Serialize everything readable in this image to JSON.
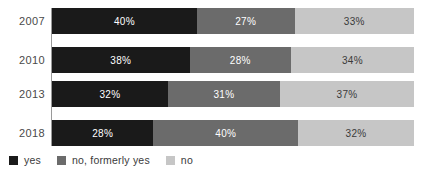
{
  "chart_data": {
    "type": "bar",
    "subtype": "stacked-horizontal-100",
    "title": "",
    "subtitle": "",
    "xlabel": "",
    "ylabel": "",
    "xlim": [
      0,
      100
    ],
    "grid": false,
    "legend_position": "bottom-left",
    "categories": [
      "2007",
      "2010",
      "2013",
      "2018"
    ],
    "series": [
      {
        "name": "yes",
        "color": "#1a1a1a",
        "values": [
          40,
          38,
          32,
          28
        ],
        "labels": [
          "40%",
          "38%",
          "32%",
          "28%"
        ]
      },
      {
        "name": "no, formerly yes",
        "color": "#6b6b6b",
        "values": [
          27,
          28,
          31,
          40
        ],
        "labels": [
          "27%",
          "28%",
          "31%",
          "40%"
        ]
      },
      {
        "name": "no",
        "color": "#c6c6c6",
        "values": [
          33,
          34,
          37,
          32
        ],
        "labels": [
          "33%",
          "34%",
          "37%",
          "32%"
        ]
      }
    ],
    "rows": [
      {
        "category": "2007",
        "segments": [
          {
            "name": "yes",
            "value": 40,
            "label": "40%"
          },
          {
            "name": "no, formerly yes",
            "value": 27,
            "label": "27%"
          },
          {
            "name": "no",
            "value": 33,
            "label": "33%"
          }
        ]
      },
      {
        "category": "2010",
        "segments": [
          {
            "name": "yes",
            "value": 38,
            "label": "38%"
          },
          {
            "name": "no, formerly yes",
            "value": 28,
            "label": "28%"
          },
          {
            "name": "no",
            "value": 34,
            "label": "34%"
          }
        ]
      },
      {
        "category": "2013",
        "segments": [
          {
            "name": "yes",
            "value": 32,
            "label": "32%"
          },
          {
            "name": "no, formerly yes",
            "value": 31,
            "label": "31%"
          },
          {
            "name": "no",
            "value": 37,
            "label": "37%"
          }
        ]
      },
      {
        "category": "2018",
        "segments": [
          {
            "name": "yes",
            "value": 28,
            "label": "28%"
          },
          {
            "name": "no, formerly yes",
            "value": 40,
            "label": "40%"
          },
          {
            "name": "no",
            "value": 32,
            "label": "32%"
          }
        ]
      }
    ],
    "legend": [
      {
        "label": "yes",
        "color": "#1a1a1a"
      },
      {
        "label": "no, formerly yes",
        "color": "#6b6b6b"
      },
      {
        "label": "no",
        "color": "#c6c6c6"
      }
    ],
    "colors": {
      "yes": "#1a1a1a",
      "no_formerly_yes": "#6b6b6b",
      "no": "#c6c6c6",
      "axis": "#9a9a9a",
      "category_label": "#4a4a4a",
      "background": "#ffffff"
    }
  }
}
